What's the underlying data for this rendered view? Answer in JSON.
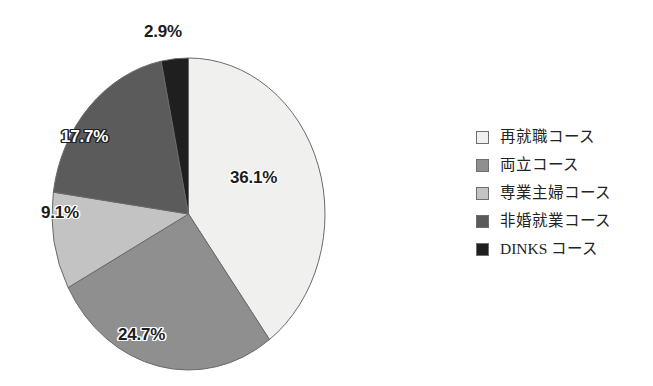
{
  "chart_data": {
    "type": "pie",
    "title": "",
    "categories": [
      "再就職コース",
      "両立コース",
      "専業主婦コース",
      "非婚就業コース",
      "DINKS コース"
    ],
    "values": [
      36.1,
      24.7,
      9.1,
      17.7,
      2.9
    ],
    "value_labels": [
      "36.1%",
      "24.7%",
      "9.1%",
      "17.7%",
      "2.9%"
    ],
    "unit": "%",
    "start_angle_deg": 0,
    "direction": "clockwise",
    "legend_position": "right",
    "grid": false,
    "colors": [
      "#f0f0ee",
      "#8f8f8f",
      "#c3c3c3",
      "#5b5b5b",
      "#1f1f1f"
    ],
    "label_text_colors": [
      "#1c1c1c",
      "#1c1c1c",
      "#1c1c1c",
      "#ffffff",
      "#1c1c1c"
    ]
  },
  "legend": {
    "items": [
      {
        "label": "再就職コース",
        "swatch": "#f0f0ee"
      },
      {
        "label": "両立コース",
        "swatch": "#8f8f8f"
      },
      {
        "label": "専業主婦コース",
        "swatch": "#c3c3c3"
      },
      {
        "label": "非婚就業コース",
        "swatch": "#5b5b5b"
      },
      {
        "label": "DINKS コース",
        "swatch": "#1f1f1f"
      }
    ]
  },
  "slice_labels": {
    "s0": "36.1%",
    "s1": "24.7%",
    "s2": "9.1%",
    "s3": "17.7%",
    "s4": "2.9%"
  }
}
